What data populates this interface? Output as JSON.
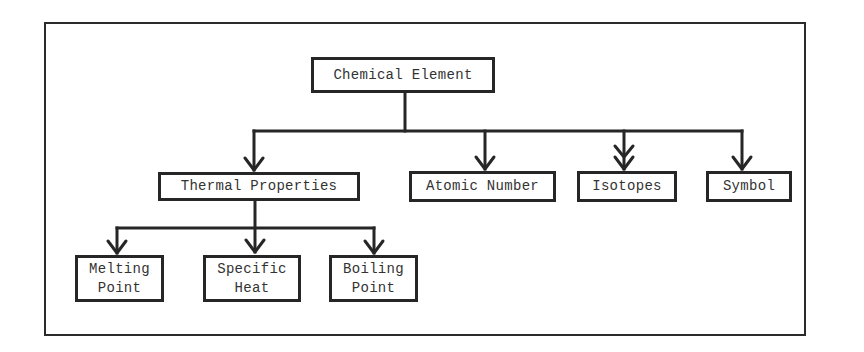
{
  "diagram": {
    "type": "hierarchy-tree",
    "root": {
      "id": "chemical-element",
      "label": "Chemical Element"
    },
    "level2": [
      {
        "id": "thermal-properties",
        "label": "Thermal Properties"
      },
      {
        "id": "atomic-number",
        "label": "Atomic Number"
      },
      {
        "id": "isotopes",
        "label": "Isotopes",
        "arrow": "double-arrowhead"
      },
      {
        "id": "symbol",
        "label": "Symbol"
      }
    ],
    "level3": [
      {
        "id": "melting-point",
        "parent": "thermal-properties",
        "label": "Melting\nPoint"
      },
      {
        "id": "specific-heat",
        "parent": "thermal-properties",
        "label": "Specific\nHeat"
      },
      {
        "id": "boiling-point",
        "parent": "thermal-properties",
        "label": "Boiling\nPoint"
      }
    ],
    "edges": [
      [
        "chemical-element",
        "thermal-properties"
      ],
      [
        "chemical-element",
        "atomic-number"
      ],
      [
        "chemical-element",
        "isotopes"
      ],
      [
        "chemical-element",
        "symbol"
      ],
      [
        "thermal-properties",
        "melting-point"
      ],
      [
        "thermal-properties",
        "specific-heat"
      ],
      [
        "thermal-properties",
        "boiling-point"
      ]
    ],
    "colors": {
      "stroke": "#262626",
      "text": "#333333",
      "background": "#ffffff"
    }
  }
}
